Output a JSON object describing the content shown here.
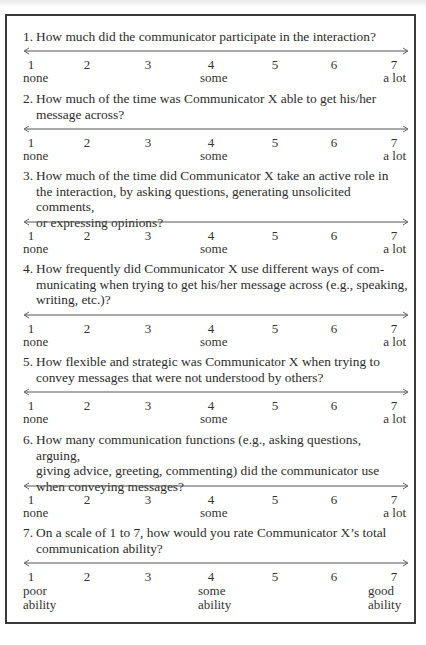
{
  "scale": {
    "points": [
      "1",
      "2",
      "3",
      "4",
      "5",
      "6",
      "7"
    ],
    "arrow_left": "<",
    "arrow_right": ">"
  },
  "items": [
    {
      "number": "1.",
      "lines": [
        "How much did the communicator participate in the interaction?"
      ],
      "anchors": {
        "low": "none",
        "mid": "some",
        "high": "a lot"
      }
    },
    {
      "number": "2.",
      "lines": [
        "How much of the time was Communicator X able to get his/her",
        "message across?"
      ],
      "anchors": {
        "low": "none",
        "mid": "some",
        "high": "a lot"
      }
    },
    {
      "number": "3.",
      "lines": [
        "How much of the time did Communicator X take an active role in",
        "the interaction, by asking questions, generating unsolicited comments,",
        "or expressing opinions?"
      ],
      "anchors": {
        "low": "none",
        "mid": "some",
        "high": "a lot"
      }
    },
    {
      "number": "4.",
      "lines": [
        "How frequently did Communicator X use different ways of com-",
        "municating when trying to get his/her message across (e.g., speaking,",
        "writing, etc.)?"
      ],
      "anchors": {
        "low": "none",
        "mid": "some",
        "high": "a lot"
      }
    },
    {
      "number": "5.",
      "lines": [
        "How flexible and strategic was Communicator X when trying to",
        "convey messages that were not understood by others?"
      ],
      "anchors": {
        "low": "none",
        "mid": "some",
        "high": "a lot"
      }
    },
    {
      "number": "6.",
      "lines": [
        "How many communication functions (e.g., asking questions, arguing,",
        "giving advice, greeting, commenting) did the communicator use",
        "when conveying messages?"
      ],
      "anchors": {
        "low": "none",
        "mid": "some",
        "high": "a lot"
      }
    },
    {
      "number": "7.",
      "lines": [
        "On a scale of 1 to 7, how would you rate Communicator X’s total",
        "communication ability?"
      ],
      "anchors": {
        "low": "poor",
        "low2": "ability",
        "mid": "some",
        "mid2": "ability",
        "high": "good",
        "high2": "ability"
      }
    }
  ]
}
